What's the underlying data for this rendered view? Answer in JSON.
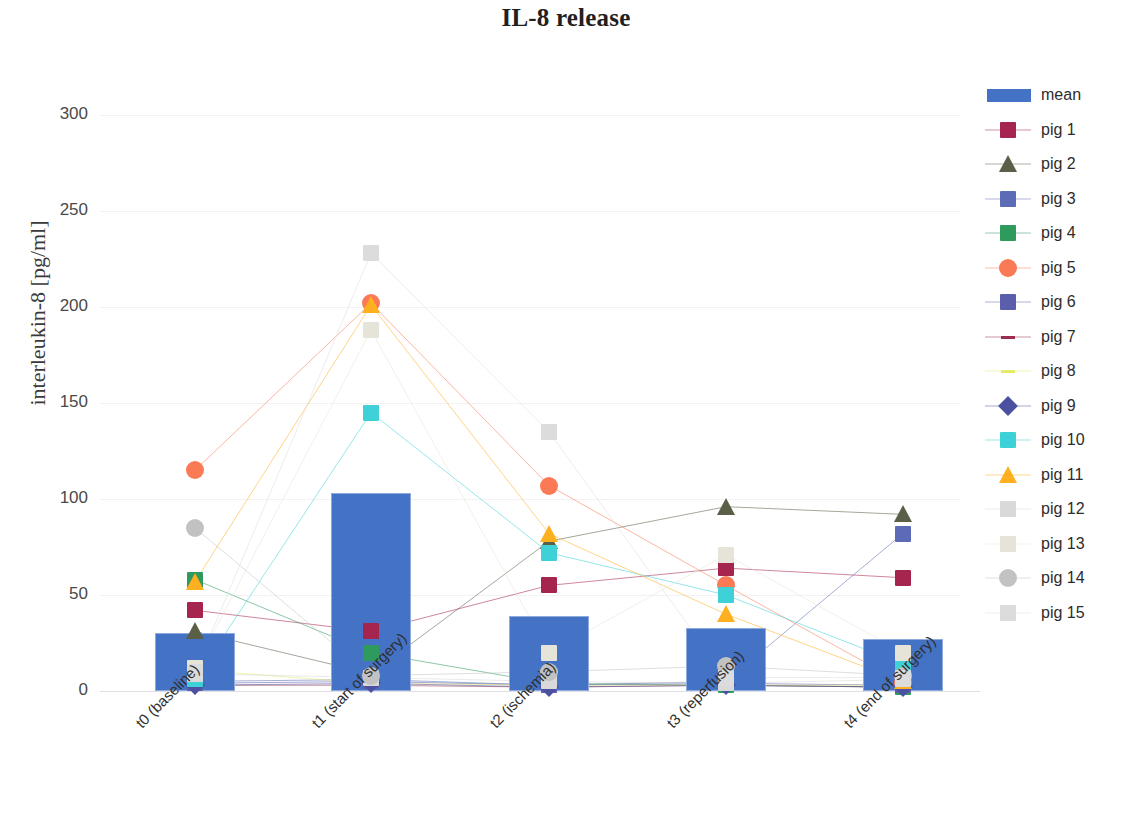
{
  "chart_data": {
    "type": "bar",
    "title": "IL-8 release",
    "xlabel": "",
    "ylabel": "interleukin-8 [pg/ml]",
    "ylim": [
      0,
      300
    ],
    "yticks": [
      0,
      50,
      100,
      150,
      200,
      250,
      300
    ],
    "grid": true,
    "legend_position": "right",
    "categories": [
      "t0 (baseline)",
      "t1 (start of surgery)",
      "t2 (ischemia)",
      "t3 (reperfusion)",
      "t4 (end of surgery)"
    ],
    "series": [
      {
        "name": "mean",
        "color": "#4472c4",
        "marker": "bar",
        "values": [
          30,
          103,
          39,
          33,
          27
        ]
      },
      {
        "name": "pig 1",
        "color": "#a5254f",
        "marker": "square",
        "values": [
          42,
          31,
          55,
          64,
          59
        ]
      },
      {
        "name": "pig 2",
        "color": "#5a5f48",
        "marker": "triangle",
        "values": [
          31,
          9,
          78,
          96,
          92
        ]
      },
      {
        "name": "pig 3",
        "color": "#5b6bb5",
        "marker": "square",
        "values": [
          5,
          6,
          3,
          5,
          82
        ]
      },
      {
        "name": "pig 4",
        "color": "#2e9a5d",
        "marker": "square",
        "values": [
          58,
          20,
          4,
          3,
          2
        ]
      },
      {
        "name": "pig 5",
        "color": "#fa7a55",
        "marker": "circle",
        "values": [
          115,
          202,
          107,
          55,
          4
        ]
      },
      {
        "name": "pig 6",
        "color": "#5b5fab",
        "marker": "square",
        "values": [
          4,
          5,
          3,
          4,
          3
        ]
      },
      {
        "name": "pig 7",
        "color": "#9b2d4e",
        "marker": "line",
        "values": [
          3,
          3,
          2,
          3,
          2
        ]
      },
      {
        "name": "pig 8",
        "color": "#e2ec6a",
        "marker": "line",
        "values": [
          11,
          4,
          3,
          3,
          3
        ]
      },
      {
        "name": "pig 9",
        "color": "#4b51a0",
        "marker": "diamond",
        "values": [
          3,
          4,
          2,
          3,
          2
        ]
      },
      {
        "name": "pig 10",
        "color": "#3fd1d8",
        "marker": "square",
        "values": [
          6,
          145,
          72,
          50,
          14
        ]
      },
      {
        "name": "pig 11",
        "color": "#ffb020",
        "marker": "triangle",
        "values": [
          57,
          201,
          82,
          40,
          5
        ]
      },
      {
        "name": "pig 12",
        "color": "#d9d9d9",
        "marker": "square",
        "values": [
          9,
          7,
          5,
          4,
          6
        ]
      },
      {
        "name": "pig 13",
        "color": "#e6e4d8",
        "marker": "square",
        "values": [
          12,
          188,
          20,
          71,
          20
        ]
      },
      {
        "name": "pig 14",
        "color": "#c2c2c2",
        "marker": "circle",
        "values": [
          85,
          8,
          10,
          13,
          8
        ]
      },
      {
        "name": "pig 15",
        "color": "#dcdcdc",
        "marker": "square",
        "values": [
          10,
          228,
          135,
          7,
          7
        ]
      }
    ]
  },
  "legend": {
    "entries": [
      {
        "label": "mean"
      },
      {
        "label": "pig 1"
      },
      {
        "label": "pig 2"
      },
      {
        "label": "pig 3"
      },
      {
        "label": "pig 4"
      },
      {
        "label": "pig 5"
      },
      {
        "label": "pig 6"
      },
      {
        "label": "pig 7"
      },
      {
        "label": "pig 8"
      },
      {
        "label": "pig 9"
      },
      {
        "label": "pig 10"
      },
      {
        "label": "pig 11"
      },
      {
        "label": "pig 12"
      },
      {
        "label": "pig 13"
      },
      {
        "label": "pig 14"
      },
      {
        "label": "pig 15"
      }
    ]
  }
}
